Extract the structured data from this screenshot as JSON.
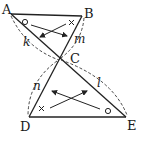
{
  "diagram": {
    "points": [
      {
        "label": "A",
        "x": 11,
        "y": 14,
        "lx": 3,
        "ly": 14
      },
      {
        "label": "B",
        "x": 82,
        "y": 16,
        "lx": 85,
        "ly": 18
      },
      {
        "label": "C",
        "x": 59,
        "y": 59,
        "lx": 70,
        "ly": 62
      },
      {
        "label": "D",
        "x": 29,
        "y": 117,
        "lx": 20,
        "ly": 131
      },
      {
        "label": "E",
        "x": 126,
        "y": 117,
        "lx": 127,
        "ly": 129
      }
    ],
    "segment_labels": {
      "k": "k",
      "m": "m",
      "n": "n",
      "l": "l"
    },
    "angle_marks": {
      "circle": "○",
      "cross": "×"
    },
    "labels": {
      "A": "A",
      "B": "B",
      "C": "C",
      "D": "D",
      "E": "E"
    }
  }
}
